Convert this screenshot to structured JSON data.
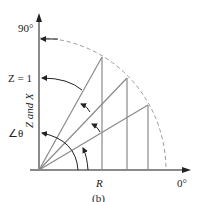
{
  "diagram": {
    "caption": "(b)",
    "labels": {
      "top_angle": "90°",
      "right_angle": "0°",
      "z_eq": "Z = 1",
      "y_axis": "Z and X",
      "theta": "∠θ",
      "x_axis": "R"
    },
    "colors": {
      "axis": "#8a8a8a",
      "ray": "#8a8a8a",
      "arc_dashed": "#9a9a9a",
      "arrow": "#222222",
      "text": "#222222"
    },
    "icons": {
      "axis_arrow": "arrowhead"
    }
  }
}
